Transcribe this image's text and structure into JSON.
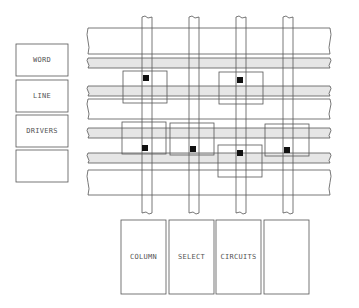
{
  "diagram": {
    "type": "memory-array-layout",
    "colors": {
      "line": "#555555",
      "shaded_band": "#e6e6e6",
      "wide_band": "#ffffff",
      "contact": "#111111"
    },
    "word_line_drivers": {
      "boxes": [
        {
          "label": "WORD"
        },
        {
          "label": "LINE"
        },
        {
          "label": "DRIVERS"
        },
        {
          "label": ""
        }
      ]
    },
    "column_select_circuits": {
      "boxes": [
        {
          "label": "COLUMN"
        },
        {
          "label": "SELECT"
        },
        {
          "label": "CIRCUITS"
        },
        {
          "label": ""
        }
      ]
    },
    "horizontal_bands": [
      {
        "kind": "wide",
        "y": 28,
        "h": 26
      },
      {
        "kind": "shaded",
        "y": 58,
        "h": 10
      },
      {
        "kind": "shaded",
        "y": 86,
        "h": 10
      },
      {
        "kind": "wide",
        "y": 99,
        "h": 20
      },
      {
        "kind": "shaded",
        "y": 128,
        "h": 10
      },
      {
        "kind": "shaded",
        "y": 153,
        "h": 10
      },
      {
        "kind": "wide",
        "y": 170,
        "h": 25
      }
    ],
    "vertical_columns": [
      {
        "x": 142
      },
      {
        "x": 189
      },
      {
        "x": 236
      },
      {
        "x": 283
      }
    ],
    "cells": [
      {
        "x": 123,
        "y": 71,
        "dot_x": 143,
        "dot_y": 75
      },
      {
        "x": 219,
        "y": 72,
        "dot_x": 237,
        "dot_y": 77
      },
      {
        "x": 122,
        "y": 122,
        "dot_x": 142,
        "dot_y": 145
      },
      {
        "x": 170,
        "y": 123,
        "dot_x": 190,
        "dot_y": 146
      },
      {
        "x": 218,
        "y": 145,
        "dot_x": 237,
        "dot_y": 150
      },
      {
        "x": 265,
        "y": 124,
        "dot_x": 284,
        "dot_y": 147
      }
    ]
  }
}
